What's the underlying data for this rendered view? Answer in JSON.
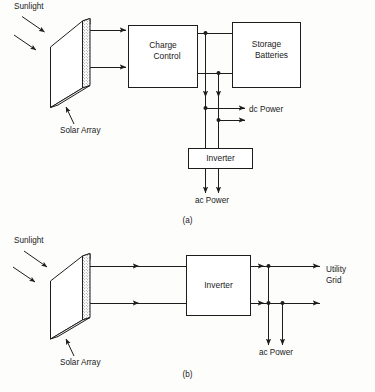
{
  "figure": {
    "background_color": "#fdfdfc",
    "line_color": "#1d1d1d"
  },
  "diagram_a": {
    "caption": "(a)",
    "labels": {
      "sunlight": "Sunlight",
      "solar_array": "Solar Array",
      "charge_control": "Charge\nControl",
      "charge_control_line1": "Charge",
      "charge_control_line2": "Control",
      "storage_batteries_line1": "Storage",
      "storage_batteries_line2": "Batteries",
      "inverter": "Inverter",
      "dc_power": "dc Power",
      "ac_power": "ac Power"
    },
    "blocks": [
      {
        "name": "charge-control",
        "label": "Charge Control"
      },
      {
        "name": "storage-batteries",
        "label": "Storage Batteries"
      },
      {
        "name": "inverter",
        "label": "Inverter"
      }
    ],
    "outputs": [
      "dc Power",
      "ac Power"
    ]
  },
  "diagram_b": {
    "caption": "(b)",
    "labels": {
      "sunlight": "Sunlight",
      "solar_array": "Solar Array",
      "inverter": "Inverter",
      "utility_grid_line1": "Utility",
      "utility_grid_line2": "Grid",
      "ac_power": "ac Power"
    },
    "blocks": [
      {
        "name": "inverter",
        "label": "Inverter"
      }
    ],
    "outputs": [
      "Utility Grid",
      "ac Power"
    ]
  }
}
